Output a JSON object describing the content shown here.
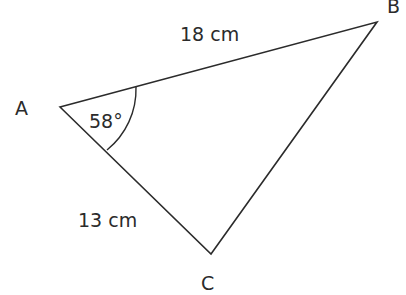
{
  "diagram": {
    "type": "triangle",
    "vertices": [
      {
        "name": "A",
        "x": 60,
        "y": 107
      },
      {
        "name": "B",
        "x": 377,
        "y": 22
      },
      {
        "name": "C",
        "x": 211,
        "y": 254
      }
    ],
    "labels": {
      "vertex_a": "A",
      "vertex_b": "B",
      "vertex_c": "C",
      "side_ab": "18 cm",
      "side_ac": "13 cm",
      "angle_a": "58°"
    },
    "stroke_color": "#2b2b2b"
  }
}
